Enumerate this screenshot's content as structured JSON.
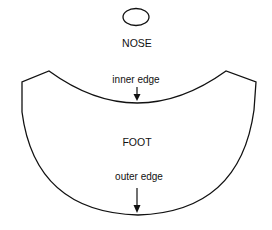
{
  "labels": {
    "nose": "NOSE",
    "inner_edge": "inner edge",
    "foot": "FOOT",
    "outer_edge": "outer edge"
  },
  "colors": {
    "stroke": "#111111",
    "background": "#ffffff"
  }
}
